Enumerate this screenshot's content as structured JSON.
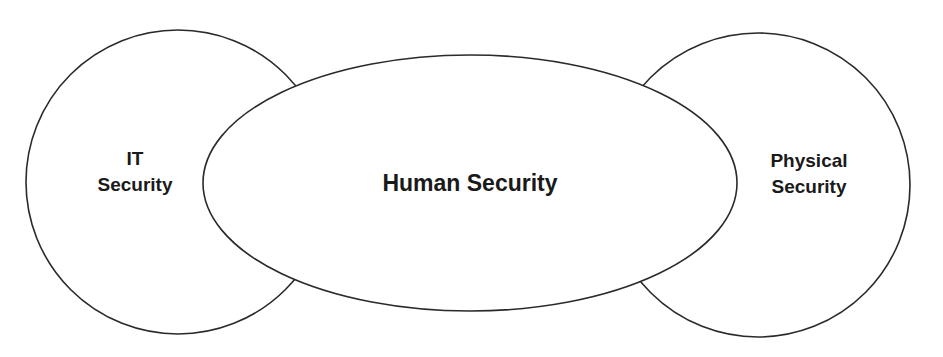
{
  "diagram": {
    "shapes": [
      {
        "id": "it-security",
        "type": "circle",
        "lines": [
          "IT",
          "Security"
        ]
      },
      {
        "id": "human-security",
        "type": "ellipse",
        "lines": [
          "Human Security"
        ]
      },
      {
        "id": "physical-security",
        "type": "circle",
        "lines": [
          "Physical",
          "Security"
        ]
      }
    ],
    "colors": {
      "stroke": "#2a2a2a",
      "fill": "#ffffff",
      "text": "#1a1a1a"
    }
  }
}
